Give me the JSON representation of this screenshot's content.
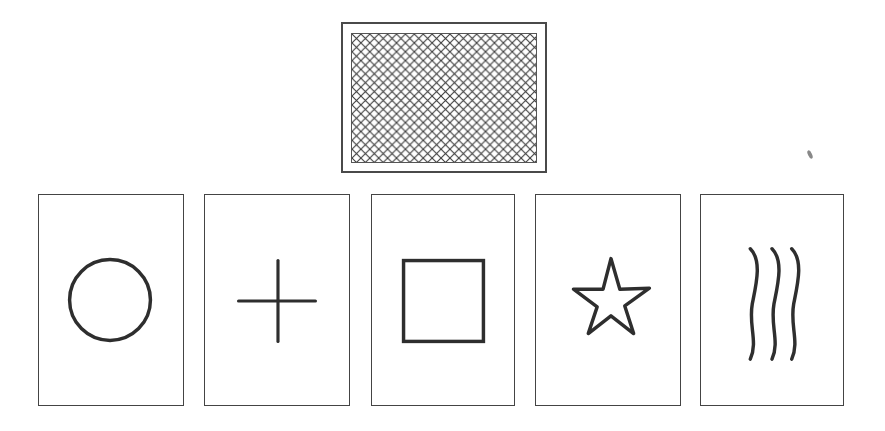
{
  "figure": {
    "stroke_color": "#2e2e2e",
    "top_card": {
      "name": "card-back",
      "pattern": "crosshatch"
    },
    "cards": [
      {
        "symbol": "circle"
      },
      {
        "symbol": "cross"
      },
      {
        "symbol": "square"
      },
      {
        "symbol": "star"
      },
      {
        "symbol": "wavy-lines"
      }
    ]
  }
}
